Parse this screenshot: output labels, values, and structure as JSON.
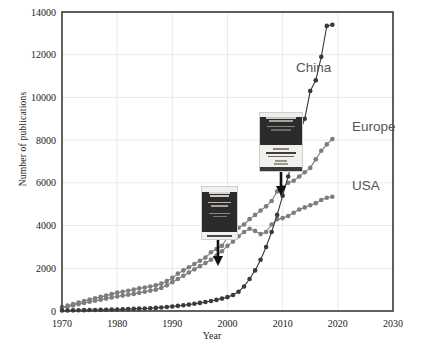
{
  "figure": {
    "background": "#ffffff",
    "frame_color": "#3a3a3a",
    "grid_color": "#e9e9e9"
  },
  "axes": {
    "x_title": "Year",
    "y_title": "Number of publications",
    "x_ticks": [
      "1970",
      "1980",
      "1990",
      "2000",
      "2010",
      "2020",
      "2030"
    ],
    "y_ticks": [
      "0",
      "2000",
      "4000",
      "6000",
      "8000",
      "10000",
      "12000",
      "14000"
    ]
  },
  "series_labels": {
    "china": "China",
    "europe": "Europe",
    "usa": "USA"
  },
  "insets": {
    "cover_left": {
      "name": "book-cover-1997",
      "title_lines": [
        "SURFACE",
        "ANALYSIS"
      ],
      "arrow": "down-arrow"
    },
    "cover_right": {
      "name": "book-cover-2009",
      "title_lines": [
        "Surface Analysis",
        "The Principal Techniques"
      ],
      "arrow": "down-arrow"
    }
  },
  "chart_data": {
    "type": "line",
    "title": "",
    "xlabel": "Year",
    "ylabel": "Number of publications",
    "xlim": [
      1970,
      2030
    ],
    "ylim": [
      0,
      14000
    ],
    "grid": true,
    "legend": "inline-series-labels",
    "colors": {
      "China": "#3a3a3a",
      "Europe": "#7d7d7d",
      "USA": "#7d7d7d"
    },
    "annotations": [
      {
        "text": "Surface Analysis book cover (1st ed.)",
        "x": 1997,
        "y": 3000,
        "type": "image-with-arrow"
      },
      {
        "text": "Surface Analysis book cover (2nd ed.)",
        "x": 2009,
        "y": 5600,
        "type": "image-with-arrow"
      }
    ],
    "series": [
      {
        "name": "Europe",
        "x": [
          1970,
          1971,
          1972,
          1973,
          1974,
          1975,
          1976,
          1977,
          1978,
          1979,
          1980,
          1981,
          1982,
          1983,
          1984,
          1985,
          1986,
          1987,
          1988,
          1989,
          1990,
          1991,
          1992,
          1993,
          1994,
          1995,
          1996,
          1997,
          1998,
          1999,
          2000,
          2001,
          2002,
          2003,
          2004,
          2005,
          2006,
          2007,
          2008,
          2009,
          2010,
          2011,
          2012,
          2013,
          2014,
          2015,
          2016,
          2017,
          2018,
          2019
        ],
        "values": [
          180,
          250,
          320,
          400,
          470,
          540,
          600,
          660,
          720,
          790,
          860,
          900,
          950,
          1000,
          1060,
          1100,
          1150,
          1200,
          1280,
          1400,
          1550,
          1750,
          1900,
          2050,
          2200,
          2350,
          2500,
          2750,
          2900,
          3050,
          3450,
          3800,
          3900,
          4050,
          4300,
          4500,
          4700,
          4900,
          5150,
          5600,
          5800,
          6000,
          6100,
          6300,
          6500,
          6700,
          7100,
          7500,
          7800,
          8050
        ]
      },
      {
        "name": "USA",
        "x": [
          1970,
          1971,
          1972,
          1973,
          1974,
          1975,
          1976,
          1977,
          1978,
          1979,
          1980,
          1981,
          1982,
          1983,
          1984,
          1985,
          1986,
          1987,
          1988,
          1989,
          1990,
          1991,
          1992,
          1993,
          1994,
          1995,
          1996,
          1997,
          1998,
          1999,
          2000,
          2001,
          2002,
          2003,
          2004,
          2005,
          2006,
          2007,
          2008,
          2009,
          2010,
          2011,
          2012,
          2013,
          2014,
          2015,
          2016,
          2017,
          2018,
          2019
        ],
        "values": [
          150,
          200,
          260,
          320,
          380,
          430,
          480,
          530,
          580,
          630,
          680,
          720,
          760,
          800,
          850,
          900,
          950,
          1000,
          1080,
          1200,
          1350,
          1500,
          1650,
          1800,
          1950,
          2100,
          2250,
          2400,
          2600,
          2800,
          3050,
          3250,
          3500,
          3700,
          3850,
          3750,
          3600,
          3700,
          4050,
          4300,
          4350,
          4450,
          4600,
          4750,
          4850,
          4950,
          5050,
          5200,
          5300,
          5350
        ]
      },
      {
        "name": "China",
        "x": [
          1970,
          1971,
          1972,
          1973,
          1974,
          1975,
          1976,
          1977,
          1978,
          1979,
          1980,
          1981,
          1982,
          1983,
          1984,
          1985,
          1986,
          1987,
          1988,
          1989,
          1990,
          1991,
          1992,
          1993,
          1994,
          1995,
          1996,
          1997,
          1998,
          1999,
          2000,
          2001,
          2002,
          2003,
          2004,
          2005,
          2006,
          2007,
          2008,
          2009,
          2010,
          2011,
          2012,
          2013,
          2014,
          2015,
          2016,
          2017,
          2018,
          2019
        ],
        "values": [
          20,
          25,
          30,
          35,
          40,
          45,
          50,
          55,
          60,
          65,
          70,
          80,
          90,
          100,
          110,
          120,
          130,
          145,
          165,
          185,
          210,
          240,
          270,
          300,
          340,
          380,
          420,
          470,
          520,
          580,
          650,
          750,
          900,
          1150,
          1500,
          1900,
          2400,
          3000,
          3700,
          4500,
          5400,
          6300,
          7300,
          8300,
          9000,
          10300,
          10800,
          11900,
          13350,
          13400
        ]
      }
    ]
  }
}
